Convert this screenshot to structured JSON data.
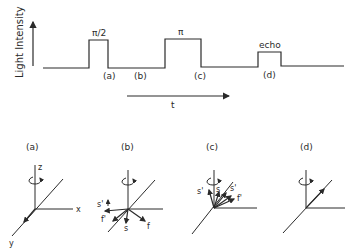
{
  "pulse_sequence": {
    "y_axis_label": "Light Intensity",
    "x_axis_label": "t",
    "pulses": [
      {
        "label": "π/2",
        "start_x": 89,
        "end_x": 108,
        "height": 28
      },
      {
        "label": "π",
        "start_x": 165,
        "end_x": 201,
        "height": 29
      },
      {
        "label": "echo",
        "start_x": 258,
        "end_x": 281,
        "height": 16
      }
    ],
    "time_markers": [
      "(a)",
      "(b)",
      "(c)",
      "(d)"
    ]
  },
  "vector_diagrams": [
    {
      "label": "(a)",
      "axis_labels": {
        "z": "z",
        "x": "x",
        "y": "y"
      },
      "vectors": [
        "along -y"
      ]
    },
    {
      "label": "(b)",
      "vector_labels": [
        "s'",
        "f'",
        "s",
        "f"
      ]
    },
    {
      "label": "(c)",
      "vector_labels": [
        "s'",
        "s",
        "s'",
        "f'"
      ]
    },
    {
      "label": "(d)",
      "vectors": [
        "refocused along +y"
      ]
    }
  ],
  "colors": {
    "ink": "#2a2a2a",
    "background": "#ffffff"
  }
}
